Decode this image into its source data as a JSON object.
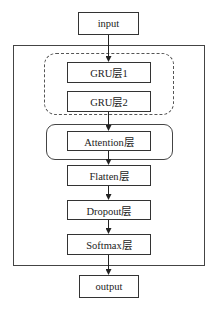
{
  "diagram": {
    "type": "flowchart",
    "title": "",
    "nodes": [
      {
        "id": "input",
        "label": "input"
      },
      {
        "id": "gru1",
        "label": "GRU层1"
      },
      {
        "id": "gru2",
        "label": "GRU层2"
      },
      {
        "id": "attention",
        "label": "Attention层"
      },
      {
        "id": "flatten",
        "label": "Flatten层"
      },
      {
        "id": "dropout",
        "label": "Dropout层"
      },
      {
        "id": "softmax",
        "label": "Softmax层"
      },
      {
        "id": "output",
        "label": "output"
      }
    ],
    "edges": [
      [
        "input",
        "gru1"
      ],
      [
        "gru2",
        "attention"
      ],
      [
        "attention",
        "flatten"
      ],
      [
        "flatten",
        "dropout"
      ],
      [
        "dropout",
        "softmax"
      ],
      [
        "softmax",
        "output"
      ]
    ],
    "groups": [
      {
        "id": "model",
        "style": "solid-rect",
        "contains": [
          "gru1",
          "gru2",
          "attention",
          "flatten",
          "dropout",
          "softmax"
        ]
      },
      {
        "id": "gru-block",
        "style": "dashed-rounded",
        "contains": [
          "gru1",
          "gru2"
        ]
      },
      {
        "id": "attention-block",
        "style": "solid-rounded",
        "contains": [
          "attention"
        ]
      }
    ]
  }
}
